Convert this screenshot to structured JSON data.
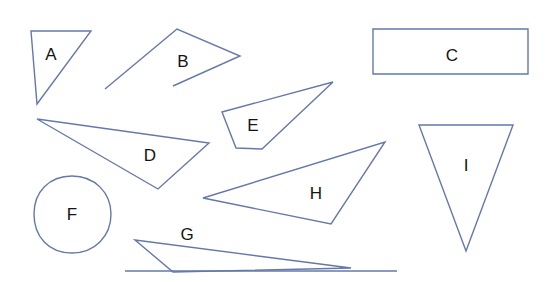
{
  "canvas": {
    "width": 554,
    "height": 282,
    "background": "#ffffff",
    "stroke_color": "#6478aa",
    "label_color": "#141414",
    "stroke_width": 1.4
  },
  "figure": {
    "label_font_size": 17
  },
  "shapes": [
    {
      "id": "A",
      "label": "A",
      "kind": "triangle",
      "closed": true,
      "points": "31,31 91,31 37,104",
      "label_x": 51,
      "label_y": 56
    },
    {
      "id": "B",
      "label": "B",
      "kind": "open-polyline",
      "closed": false,
      "points": "105,89 177,29 240,56 173,86",
      "label_x": 183,
      "label_y": 63
    },
    {
      "id": "C",
      "label": "C",
      "kind": "rectangle",
      "closed": true,
      "points": "373,29 528,29 528,74 373,74",
      "label_x": 452,
      "label_y": 57
    },
    {
      "id": "D",
      "label": "D",
      "kind": "triangle",
      "closed": true,
      "points": "37,119 209,143 158,189",
      "label_x": 150,
      "label_y": 157
    },
    {
      "id": "E",
      "label": "E",
      "kind": "quadrilateral",
      "closed": true,
      "points": "222,112 333,82 262,149 236,148",
      "label_x": 253,
      "label_y": 127
    },
    {
      "id": "F",
      "label": "F",
      "kind": "blob-ellipse",
      "closed": true,
      "path": "M 72,176 C 95,176 111,193 111,214 C 111,236 95,253 72,253 C 48,253 34,236 34,214 C 34,192 49,176 72,176 Z",
      "label_x": 72,
      "label_y": 216
    },
    {
      "id": "G",
      "label": "G",
      "kind": "thin-triangle-with-baseline",
      "closed": true,
      "points": "135,240 351,268 173,272",
      "baseline": "125,271 397,271",
      "label_x": 187,
      "label_y": 236
    },
    {
      "id": "H",
      "label": "H",
      "kind": "triangle",
      "closed": true,
      "points": "203,198 385,142 331,224",
      "label_x": 316,
      "label_y": 195
    },
    {
      "id": "I",
      "label": "I",
      "kind": "triangle",
      "closed": true,
      "points": "419,125 513,125 466,251",
      "label_x": 466,
      "label_y": 167
    }
  ]
}
